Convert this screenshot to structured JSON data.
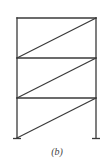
{
  "figure": {
    "caption": "(b)",
    "type": "three-story braced frame",
    "stories": 3,
    "bracing": "single diagonal per story, bottom-left to top-right",
    "supports": [
      "left-fixed",
      "right-fixed"
    ]
  }
}
